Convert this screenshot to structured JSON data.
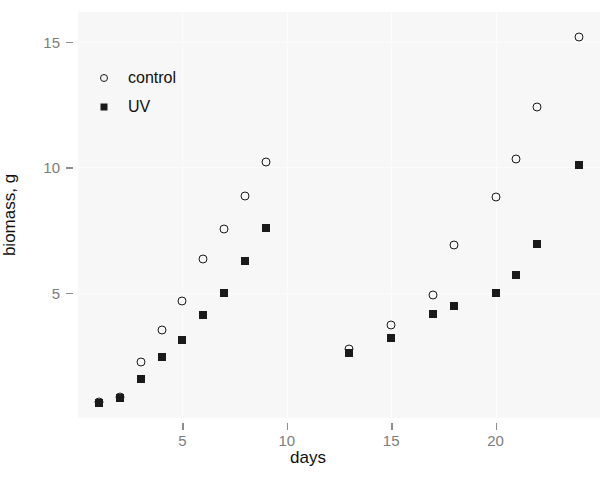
{
  "chart_data": {
    "type": "scatter",
    "title": "",
    "xlabel": "days",
    "ylabel": "biomass, g",
    "xlim": [
      0,
      25
    ],
    "ylim": [
      0,
      16.2
    ],
    "xticks": [
      5,
      10,
      15,
      20
    ],
    "yticks": [
      5,
      10,
      15
    ],
    "xtick_labels": [
      "5",
      "10",
      "15",
      "20"
    ],
    "ytick_labels": [
      "5",
      "10",
      "15"
    ],
    "grid": true,
    "legend_position": "upper-left-inside",
    "series": [
      {
        "name": "control",
        "marker": "open-circle",
        "color": "#1a1a1a",
        "x": [
          1,
          2,
          3,
          4,
          5,
          6,
          7,
          8,
          9,
          13,
          15,
          17,
          18,
          20,
          21,
          22,
          24
        ],
        "y": [
          0.65,
          0.85,
          2.25,
          3.5,
          4.65,
          6.35,
          7.55,
          8.85,
          10.2,
          2.75,
          3.7,
          4.9,
          6.9,
          8.8,
          10.35,
          12.4,
          15.2
        ]
      },
      {
        "name": "UV",
        "marker": "filled-square",
        "color": "#1a1a1a",
        "x": [
          1,
          2,
          3,
          4,
          5,
          6,
          7,
          8,
          9,
          13,
          15,
          17,
          18,
          20,
          21,
          22,
          24
        ],
        "y": [
          0.6,
          0.8,
          1.55,
          2.45,
          3.1,
          4.1,
          5.0,
          6.25,
          7.6,
          2.6,
          3.2,
          4.15,
          4.45,
          5.0,
          5.7,
          6.95,
          10.1
        ]
      }
    ]
  },
  "legend": {
    "entries": [
      {
        "label": "control",
        "marker": "open-circle"
      },
      {
        "label": "UV",
        "marker": "filled-square"
      }
    ]
  }
}
